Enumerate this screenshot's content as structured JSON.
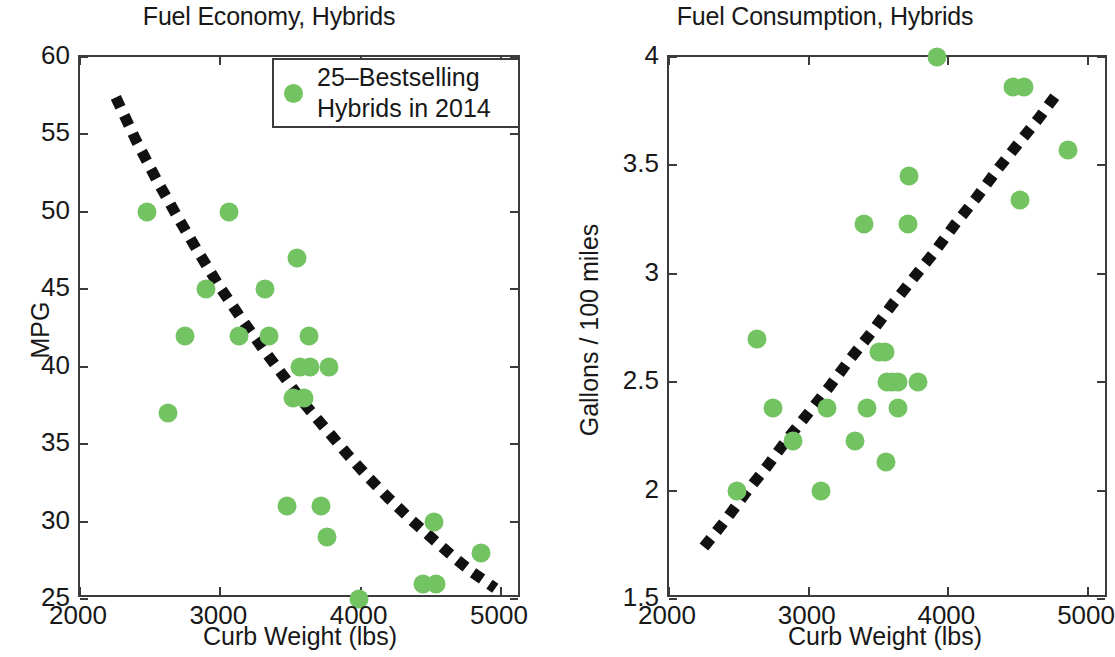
{
  "figure": {
    "background": "#ffffff",
    "marker_color": "#74c362",
    "axis_color": "#3b3b3b",
    "fit_color": "#111111"
  },
  "legend": {
    "line1": "25–Bestselling",
    "line2": "Hybrids in 2014",
    "marker": "green-filled-circle"
  },
  "chart_data": [
    {
      "id": "fuel-economy",
      "type": "scatter",
      "title": "Fuel Economy, Hybrids",
      "xlabel": "Curb Weight (lbs)",
      "ylabel": "MPG",
      "xlim": [
        2000,
        5150
      ],
      "ylim": [
        25,
        60
      ],
      "xticks": [
        2000,
        3000,
        4000,
        5000
      ],
      "xticklabels": [
        "2000",
        "3000",
        "4000",
        "5000"
      ],
      "yticks": [
        25,
        30,
        35,
        40,
        45,
        50,
        55,
        60
      ],
      "yticklabels": [
        "25",
        "30",
        "35",
        "40",
        "45",
        "50",
        "55",
        "60"
      ],
      "grid": false,
      "legend_position": "upper right",
      "series": [
        {
          "name": "25–Bestselling Hybrids in 2014",
          "color": "#74c362",
          "points": [
            [
              2475,
              50
            ],
            [
              3060,
              50
            ],
            [
              3545,
              47
            ],
            [
              3320,
              45
            ],
            [
              2900,
              45
            ],
            [
              2745,
              42
            ],
            [
              3130,
              42
            ],
            [
              3345,
              42
            ],
            [
              3630,
              42
            ],
            [
              3565,
              40
            ],
            [
              3640,
              40
            ],
            [
              3775,
              40
            ],
            [
              3520,
              38
            ],
            [
              3595,
              38
            ],
            [
              2630,
              37
            ],
            [
              3475,
              31
            ],
            [
              3720,
              31
            ],
            [
              3760,
              29
            ],
            [
              4520,
              30
            ],
            [
              4855,
              28
            ],
            [
              4445,
              26
            ],
            [
              4540,
              26
            ],
            [
              3985,
              25
            ]
          ]
        }
      ],
      "fit": {
        "style": "thick-dotted",
        "color": "#111111",
        "points": [
          [
            2255,
            57.4
          ],
          [
            2400,
            54.6
          ],
          [
            2550,
            52.0
          ],
          [
            2700,
            49.6
          ],
          [
            2850,
            47.3
          ],
          [
            3000,
            45.1
          ],
          [
            3150,
            43.1
          ],
          [
            3300,
            41.2
          ],
          [
            3450,
            39.4
          ],
          [
            3600,
            37.6
          ],
          [
            3750,
            36.0
          ],
          [
            3900,
            34.4
          ],
          [
            4050,
            32.9
          ],
          [
            4200,
            31.5
          ],
          [
            4350,
            30.2
          ],
          [
            4500,
            29.0
          ],
          [
            4650,
            27.8
          ],
          [
            4800,
            26.7
          ],
          [
            4960,
            25.7
          ]
        ]
      }
    },
    {
      "id": "fuel-consumption",
      "type": "scatter",
      "title": "Fuel Consumption, Hybrids",
      "xlabel": "Curb Weight (lbs)",
      "ylabel": "Gallons / 100 miles",
      "xlim": [
        2000,
        5150
      ],
      "ylim": [
        1.5,
        4.0
      ],
      "xticks": [
        2000,
        3000,
        4000,
        5000
      ],
      "xticklabels": [
        "2000",
        "3000",
        "4000",
        "5000"
      ],
      "yticks": [
        1.5,
        2.0,
        2.5,
        3.0,
        3.5,
        4.0
      ],
      "yticklabels": [
        "1.5",
        "2",
        "2.5",
        "3",
        "3.5",
        "4"
      ],
      "grid": false,
      "legend_position": "none",
      "series": [
        {
          "name": "25–Bestselling Hybrids in 2014",
          "color": "#74c362",
          "points": [
            [
              3920,
              4.0
            ],
            [
              4460,
              3.86
            ],
            [
              4545,
              3.86
            ],
            [
              4855,
              3.57
            ],
            [
              3720,
              3.45
            ],
            [
              4515,
              3.34
            ],
            [
              3395,
              3.23
            ],
            [
              3710,
              3.23
            ],
            [
              2630,
              2.7
            ],
            [
              3500,
              2.64
            ],
            [
              3545,
              2.64
            ],
            [
              3560,
              2.5
            ],
            [
              3600,
              2.5
            ],
            [
              3640,
              2.5
            ],
            [
              3780,
              2.5
            ],
            [
              2745,
              2.38
            ],
            [
              3130,
              2.38
            ],
            [
              3420,
              2.38
            ],
            [
              3640,
              2.38
            ],
            [
              2890,
              2.23
            ],
            [
              3335,
              2.23
            ],
            [
              3555,
              2.13
            ],
            [
              2490,
              2.0
            ],
            [
              3085,
              2.0
            ]
          ]
        }
      ],
      "fit": {
        "style": "thick-dotted",
        "color": "#111111",
        "points": [
          [
            2250,
            1.74
          ],
          [
            2400,
            1.86
          ],
          [
            2550,
            1.99
          ],
          [
            2700,
            2.11
          ],
          [
            2850,
            2.24
          ],
          [
            3000,
            2.36
          ],
          [
            3150,
            2.48
          ],
          [
            3300,
            2.61
          ],
          [
            3450,
            2.73
          ],
          [
            3600,
            2.86
          ],
          [
            3750,
            2.98
          ],
          [
            3900,
            3.1
          ],
          [
            4050,
            3.23
          ],
          [
            4200,
            3.35
          ],
          [
            4350,
            3.48
          ],
          [
            4500,
            3.6
          ],
          [
            4650,
            3.72
          ],
          [
            4800,
            3.85
          ]
        ]
      }
    }
  ]
}
